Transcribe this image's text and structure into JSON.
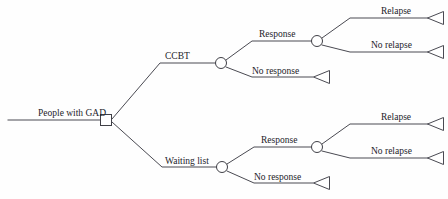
{
  "diagram": {
    "type": "decision-tree",
    "background_color": "#fefefe",
    "line_color": "#4a4a52",
    "text_color": "#23232a",
    "root": {
      "label": "People with GAD",
      "node_type": "decision-square"
    },
    "decisions": [
      {
        "label": "CCBT",
        "node_type": "chance-circle",
        "outcomes": [
          {
            "label": "Response",
            "node_type": "chance-circle",
            "outcomes": [
              {
                "label": "Relapse",
                "node_type": "terminal-triangle"
              },
              {
                "label": "No relapse",
                "node_type": "terminal-triangle"
              }
            ]
          },
          {
            "label": "No response",
            "node_type": "terminal-triangle",
            "outcomes": []
          }
        ]
      },
      {
        "label": "Waiting list",
        "node_type": "chance-circle",
        "outcomes": [
          {
            "label": "Response",
            "node_type": "chance-circle",
            "outcomes": [
              {
                "label": "Relapse",
                "node_type": "terminal-triangle"
              },
              {
                "label": "No relapse",
                "node_type": "terminal-triangle"
              }
            ]
          },
          {
            "label": "No response",
            "node_type": "terminal-triangle",
            "outcomes": []
          }
        ]
      }
    ],
    "labels": {
      "root": "People with GAD",
      "arm_top": "CCBT",
      "arm_bottom": "Waiting list",
      "top_response": "Response",
      "top_no_response": "No response",
      "top_relapse": "Relapse",
      "top_no_relapse": "No relapse",
      "bottom_response": "Response",
      "bottom_no_response": "No response",
      "bottom_relapse": "Relapse",
      "bottom_no_relapse": "No relapse"
    }
  }
}
